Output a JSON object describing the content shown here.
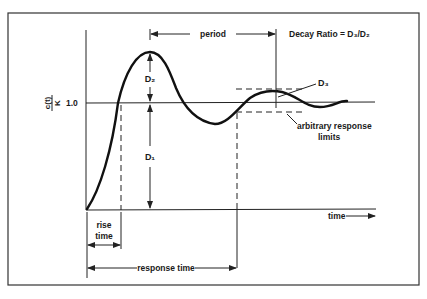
{
  "diagram": {
    "y_axis_label_numerator": "c(t)",
    "y_axis_label_denominator": "K",
    "y_tick_label": "1.0",
    "x_axis_label": "time",
    "period_label": "period",
    "decay_ratio_label": "Decay Ratio = D₃/D₂",
    "d1_label": "D₁",
    "d2_label": "D₂",
    "d3_label": "D₃",
    "limits_label_line1": "arbitrary response",
    "limits_label_line2": "limits",
    "rise_time_line1": "rise",
    "rise_time_line2": "time",
    "response_time_label": "response time"
  },
  "colors": {
    "ink": "#1a1a1a",
    "background": "#ffffff"
  }
}
